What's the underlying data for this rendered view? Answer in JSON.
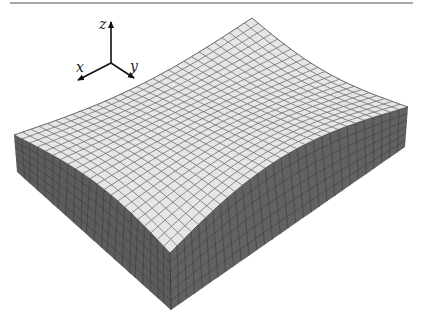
{
  "figure": {
    "top_rule": {
      "x1": 10,
      "x2": 413,
      "y": 3,
      "color": "#8a8a8a"
    },
    "colors": {
      "top_face": "#e6e6e6",
      "top_grid": "#6e6e6e",
      "left_face": "#5c5c5c",
      "right_face": "#626262",
      "side_grid": "#2e2e2e",
      "edge": "#3a3a3a"
    },
    "corners": {
      "top_left": [
        14,
        135
      ],
      "top_back": [
        252,
        18
      ],
      "top_right": [
        408,
        107
      ],
      "top_front": [
        170,
        253
      ],
      "bottom_left": [
        17,
        172
      ],
      "bottom_front": [
        171,
        310
      ],
      "bottom_right": [
        405,
        147
      ]
    },
    "edge_bulges": {
      "back_left": [
        4,
        10
      ],
      "back_right": [
        -5,
        9
      ],
      "front_left": [
        5,
        -10
      ],
      "front_right": [
        -8,
        -22
      ]
    },
    "mesh": {
      "top_divisions_u": 30,
      "top_divisions_v": 22,
      "side_vertical_divisions": 6
    }
  },
  "axes_triad": {
    "origin": [
      111,
      63
    ],
    "z": {
      "label": "z",
      "tip": [
        111,
        22
      ],
      "label_pos": [
        99,
        29
      ]
    },
    "x": {
      "label": "x",
      "tip": [
        78,
        80
      ],
      "label_pos": [
        76,
        72
      ]
    },
    "y": {
      "label": "y",
      "tip": [
        134,
        78
      ],
      "label_pos": [
        130,
        71
      ]
    }
  }
}
